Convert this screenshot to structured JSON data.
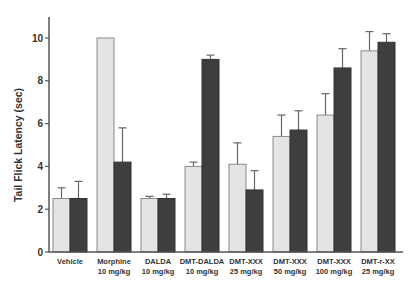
{
  "chart_data": {
    "type": "bar",
    "title": "",
    "xlabel": "",
    "ylabel": "Tail Flick Latency (sec)",
    "ylim": [
      0,
      11
    ],
    "yticks": [
      0,
      2,
      4,
      6,
      8,
      10
    ],
    "grid": false,
    "legend": null,
    "categories": [
      {
        "line1": "Vehicle",
        "line2": ""
      },
      {
        "line1": "Morphine",
        "line2": "10 mg/kg"
      },
      {
        "line1": "DALDA",
        "line2": "10 mg/kg"
      },
      {
        "line1": "DMT-DALDA",
        "line2": "10 mg/kg"
      },
      {
        "line1": "DMT-XXX",
        "line2": "25 mg/kg"
      },
      {
        "line1": "DMT-XXX",
        "line2": "50 mg/kg"
      },
      {
        "line1": "DMT-XXX",
        "line2": "100 mg/kg"
      },
      {
        "line1": "DMT-r-XX",
        "line2": "25 mg/kg"
      }
    ],
    "series": [
      {
        "name": "light",
        "color": "#e4e4e4",
        "values": [
          2.5,
          10.0,
          2.5,
          4.0,
          4.1,
          5.4,
          6.4,
          9.4
        ],
        "error_top": [
          3.0,
          null,
          2.6,
          4.2,
          5.1,
          6.4,
          7.4,
          10.3
        ]
      },
      {
        "name": "dark",
        "color": "#3e3e3e",
        "values": [
          2.5,
          4.2,
          2.5,
          9.0,
          2.9,
          5.7,
          8.6,
          9.8
        ],
        "error_top": [
          3.3,
          5.8,
          2.7,
          9.2,
          3.8,
          6.6,
          9.5,
          10.2
        ]
      }
    ]
  },
  "colors": {
    "axis": "#555555",
    "light_bar": "#e4e4e4",
    "light_bar_border": "#8a8a8a",
    "dark_bar": "#3e3e3e",
    "error_bar": "#666666"
  }
}
